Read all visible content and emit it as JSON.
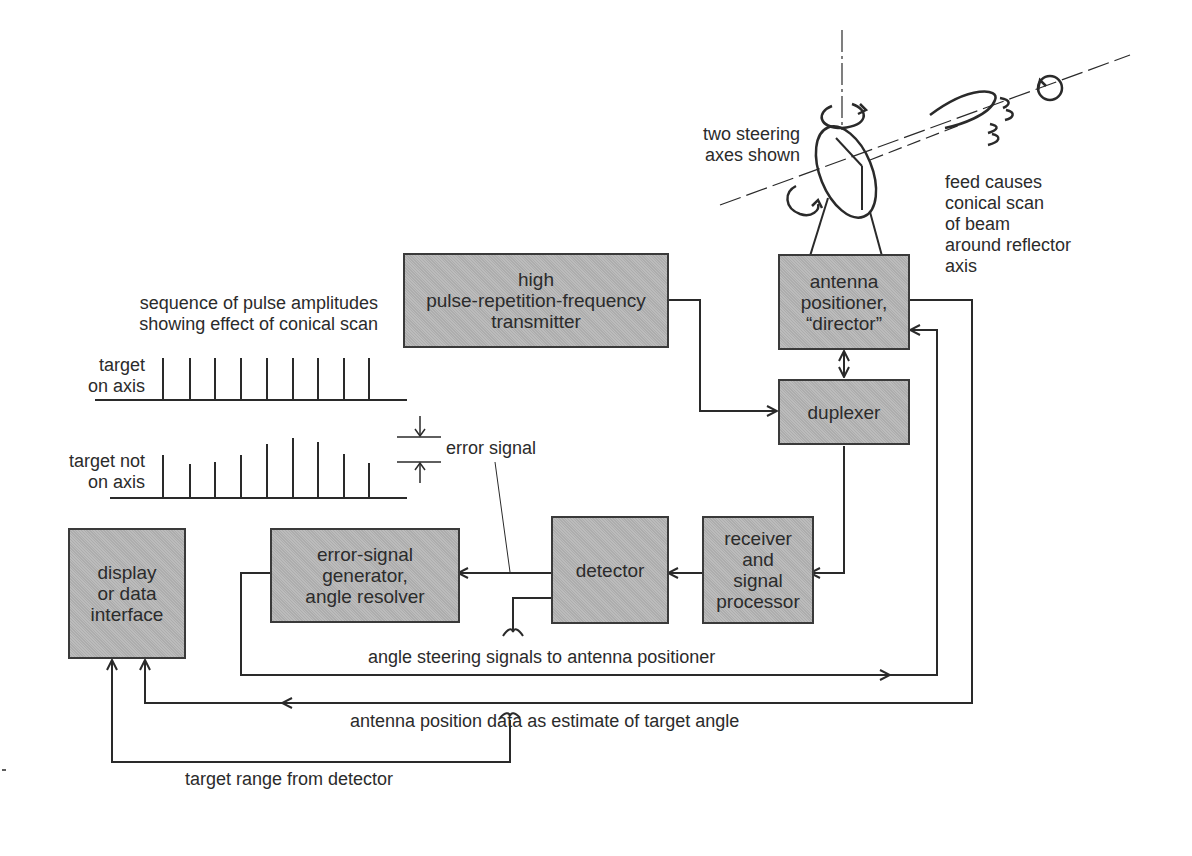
{
  "diagram": {
    "blocks": {
      "transmitter": "high\npulse-repetition-frequency\ntransmitter",
      "positioner": "antenna\npositioner,\n“director”",
      "duplexer": "duplexer",
      "receiver": "receiver\nand\nsignal\nprocessor",
      "detector": "detector",
      "error_generator": "error-signal\ngenerator,\nangle resolver",
      "display": "display\nor data\ninterface"
    },
    "annotations": {
      "steering_axes": "two steering\naxes shown",
      "feed_note": "feed causes\nconical scan\nof beam\naround reflector\naxis",
      "pulse_sequence": "sequence of pulse amplitudes\nshowing effect of conical scan",
      "on_axis": "target\non axis",
      "not_on_axis": "target not\non axis",
      "error_signal": "error signal",
      "angle_steering": "angle steering signals to antenna positioner",
      "position_data": "antenna position data as estimate of target angle",
      "target_range": "target range from detector"
    },
    "pulse_trains": {
      "on_axis_heights": [
        40,
        40,
        40,
        40,
        40,
        40,
        40,
        40,
        40
      ],
      "not_on_axis_heights": [
        40,
        30,
        32,
        38,
        50,
        56,
        52,
        40,
        31
      ]
    },
    "colors": {
      "block_fill": "#b4b4b4",
      "line": "#2a2a2a",
      "background": "#ffffff"
    }
  }
}
